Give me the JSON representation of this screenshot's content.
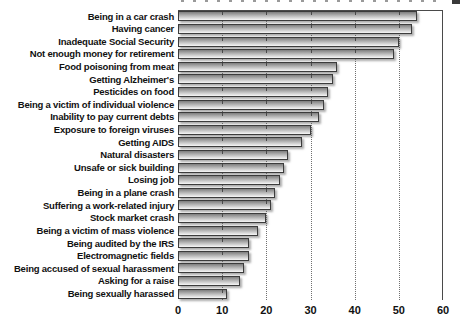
{
  "chart_data": {
    "type": "bar",
    "orientation": "horizontal",
    "title": "",
    "xlabel": "",
    "ylabel": "",
    "categories": [
      "Being in a car crash",
      "Having cancer",
      "Inadequate Social Security",
      "Not enough money for retirement",
      "Food poisoning from meat",
      "Getting Alzheimer's",
      "Pesticides on food",
      "Being a victim of individual violence",
      "Inability to pay current debts",
      "Exposure to foreign viruses",
      "Getting AIDS",
      "Natural disasters",
      "Unsafe or sick building",
      "Losing job",
      "Being in a plane crash",
      "Suffering a work-related injury",
      "Stock market crash",
      "Being a victim of mass violence",
      "Being audited by the IRS",
      "Electromagnetic fields",
      "Being accused of sexual harassment",
      "Asking for a raise",
      "Being sexually harassed"
    ],
    "values": [
      54,
      53,
      50,
      49,
      36,
      35,
      34,
      33,
      32,
      30,
      28,
      25,
      24,
      23,
      22,
      21,
      20,
      18,
      16,
      16,
      15,
      14,
      11
    ],
    "xlim": [
      0,
      60
    ],
    "xticks": [
      0,
      10,
      20,
      30,
      40,
      50,
      60
    ],
    "xtick_labels": [
      "0",
      "10",
      "20",
      "30",
      "40",
      "50",
      "60"
    ],
    "grid": "dotted vertical gridlines at 10,20,30,40,50; solid frame line at top and at 60 (right edge)",
    "legend": "none",
    "bar_style": "gray vertical gradient bars with dark border, drop shadow, and small ruler tick marks on each bar top edge every 10 units"
  },
  "colors": {
    "background": "#ffffff",
    "text": "#111111",
    "bar_gradient_top": "#7e7e7e",
    "bar_gradient_mid": "#b0b0b0",
    "bar_gradient_bottom": "#f7f7f7",
    "bar_border": "#3c3c3c",
    "bar_tick": "#4a4a4a",
    "grid_line": "#707070",
    "frame_line": "#4a4a4a"
  }
}
